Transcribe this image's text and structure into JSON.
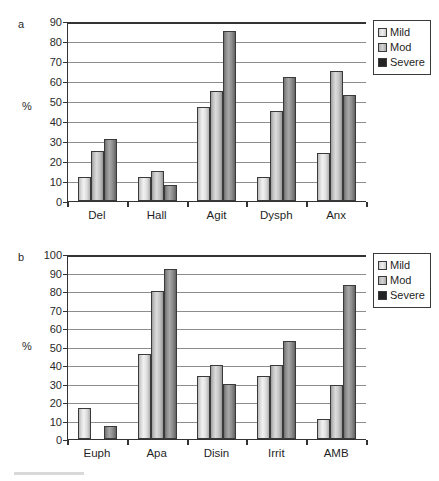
{
  "figure": {
    "panel_a_letter": "a",
    "panel_b_letter": "b",
    "y_axis_title": "%"
  },
  "legend": {
    "items": [
      {
        "label": "Mild",
        "color": "#e3e3e3",
        "key": "mild"
      },
      {
        "label": "Mod",
        "color": "#c4c4c4",
        "key": "mod"
      },
      {
        "label": "Severe",
        "color": "#232323",
        "key": "severe"
      }
    ]
  },
  "chart_data": [
    {
      "type": "bar",
      "panel": "a",
      "title": "",
      "xlabel": "",
      "ylabel": "%",
      "ylim": [
        0,
        90
      ],
      "ytick_step": 10,
      "yticks": [
        0,
        10,
        20,
        30,
        40,
        50,
        60,
        70,
        80,
        90
      ],
      "ytick_labels": [
        "0",
        "10",
        "20",
        "30",
        "40",
        "50",
        "60",
        "70",
        "80",
        "90"
      ],
      "grid": true,
      "legend_position": "right-top",
      "categories": [
        "Del",
        "Hall",
        "Agit",
        "Dysph",
        "Anx"
      ],
      "series": [
        {
          "name": "Mild",
          "values": [
            12,
            12,
            47,
            12,
            24
          ]
        },
        {
          "name": "Mod",
          "values": [
            25,
            15,
            55,
            45,
            65
          ]
        },
        {
          "name": "Severe",
          "values": [
            31,
            8,
            85,
            62,
            53
          ]
        }
      ]
    },
    {
      "type": "bar",
      "panel": "b",
      "title": "",
      "xlabel": "",
      "ylabel": "%",
      "ylim": [
        0,
        100
      ],
      "ytick_step": 10,
      "yticks": [
        0,
        10,
        20,
        30,
        40,
        50,
        60,
        70,
        80,
        90,
        100
      ],
      "ytick_labels": [
        "0",
        "10",
        "20",
        "30",
        "40",
        "50",
        "60",
        "70",
        "80",
        "90",
        "100"
      ],
      "grid": true,
      "legend_position": "right-top",
      "categories": [
        "Euph",
        "Apa",
        "Disin",
        "Irrit",
        "AMB"
      ],
      "series": [
        {
          "name": "Mild",
          "values": [
            17,
            46,
            34,
            34,
            11
          ]
        },
        {
          "name": "Mod",
          "values": [
            0,
            80,
            40,
            40,
            29
          ]
        },
        {
          "name": "Severe",
          "values": [
            7,
            92,
            30,
            53,
            83
          ]
        }
      ]
    }
  ]
}
